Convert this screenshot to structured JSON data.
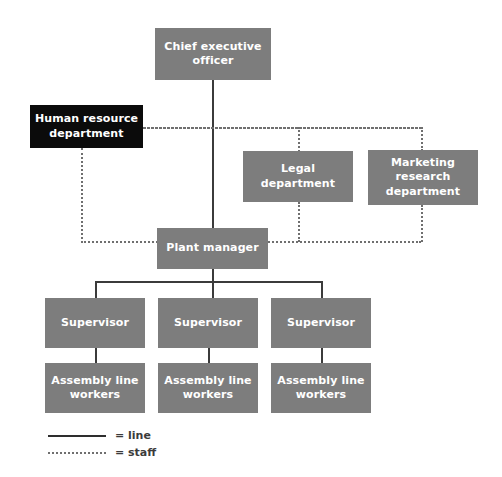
{
  "chart": {
    "type": "org-chart",
    "canvas": {
      "width": 502,
      "height": 477,
      "background": "#ffffff"
    },
    "colors": {
      "node_fill": "#7d7d7d",
      "node_fill_highlight": "#0b0b0b",
      "node_text": "#ffffff",
      "line_solid": "#3b3b3b",
      "line_staff": "#6f6f6f"
    }
  },
  "nodes": [
    {
      "id": "ceo",
      "label": "Chief executive officer",
      "style": "gray",
      "x": 155,
      "y": 28,
      "w": 116,
      "h": 52,
      "font_size": 11
    },
    {
      "id": "hr",
      "label": "Human resource department",
      "style": "black",
      "x": 30,
      "y": 105,
      "w": 113,
      "h": 43,
      "font_size": 11
    },
    {
      "id": "legal",
      "label": "Legal department",
      "style": "gray",
      "x": 243,
      "y": 151,
      "w": 110,
      "h": 51,
      "font_size": 11
    },
    {
      "id": "marketing",
      "label": "Marketing research department",
      "style": "gray",
      "x": 368,
      "y": 150,
      "w": 110,
      "h": 55,
      "font_size": 11
    },
    {
      "id": "plant",
      "label": "Plant manager",
      "style": "gray",
      "x": 157,
      "y": 228,
      "w": 111,
      "h": 41,
      "font_size": 11
    },
    {
      "id": "sup1",
      "label": "Supervisor",
      "style": "gray",
      "x": 45,
      "y": 298,
      "w": 100,
      "h": 50,
      "font_size": 11
    },
    {
      "id": "sup2",
      "label": "Supervisor",
      "style": "gray",
      "x": 158,
      "y": 298,
      "w": 100,
      "h": 50,
      "font_size": 11
    },
    {
      "id": "sup3",
      "label": "Supervisor",
      "style": "gray",
      "x": 271,
      "y": 298,
      "w": 100,
      "h": 50,
      "font_size": 11
    },
    {
      "id": "alw1",
      "label": "Assembly line workers",
      "style": "gray",
      "x": 45,
      "y": 363,
      "w": 100,
      "h": 50,
      "font_size": 11
    },
    {
      "id": "alw2",
      "label": "Assembly line workers",
      "style": "gray",
      "x": 158,
      "y": 363,
      "w": 100,
      "h": 50,
      "font_size": 11
    },
    {
      "id": "alw3",
      "label": "Assembly line workers",
      "style": "gray",
      "x": 271,
      "y": 363,
      "w": 100,
      "h": 50,
      "font_size": 11
    }
  ],
  "connectors": {
    "line": [
      {
        "id": "ceo-to-plant",
        "orient": "v",
        "x": 212,
        "y": 80,
        "len": 148
      },
      {
        "id": "plant-to-bus",
        "orient": "v",
        "x": 212,
        "y": 269,
        "len": 29
      },
      {
        "id": "supervisor-bus",
        "orient": "h",
        "x": 95,
        "y": 281,
        "len": 226
      },
      {
        "id": "bus-to-sup1",
        "orient": "v",
        "x": 95,
        "y": 281,
        "len": 17
      },
      {
        "id": "bus-to-sup3",
        "orient": "v",
        "x": 321,
        "y": 281,
        "len": 17
      },
      {
        "id": "sup1-to-alw1",
        "orient": "v",
        "x": 95,
        "y": 348,
        "len": 15
      },
      {
        "id": "sup2-to-alw2",
        "orient": "v",
        "x": 208,
        "y": 348,
        "len": 15
      },
      {
        "id": "sup3-to-alw3",
        "orient": "v",
        "x": 321,
        "y": 348,
        "len": 15
      }
    ],
    "staff": [
      {
        "id": "top-staff-bus",
        "orient": "h",
        "x": 81,
        "y": 127,
        "len": 340
      },
      {
        "id": "hr-right-stub",
        "orient": "h",
        "x": 143,
        "y": 127,
        "len": 278
      },
      {
        "id": "legal-up",
        "orient": "v",
        "x": 298,
        "y": 127,
        "len": 25
      },
      {
        "id": "marketing-up",
        "orient": "v",
        "x": 421,
        "y": 127,
        "len": 24
      },
      {
        "id": "hr-down",
        "orient": "v",
        "x": 81,
        "y": 148,
        "len": 95
      },
      {
        "id": "bottom-staff-bus",
        "orient": "h",
        "x": 81,
        "y": 241,
        "len": 340
      },
      {
        "id": "legal-down",
        "orient": "v",
        "x": 298,
        "y": 202,
        "len": 40
      },
      {
        "id": "marketing-down",
        "orient": "v",
        "x": 421,
        "y": 205,
        "len": 37
      }
    ]
  },
  "legend": {
    "items": [
      {
        "id": "legend-line",
        "swatch": "solid",
        "label": "= line"
      },
      {
        "id": "legend-staff",
        "swatch": "dotted",
        "label": "= staff"
      }
    ]
  },
  "chart_data": {
    "type": "diagram",
    "hierarchy": {
      "name": "Chief executive officer",
      "relation": "root",
      "children": [
        {
          "name": "Plant manager",
          "relation": "line",
          "children": [
            {
              "name": "Supervisor",
              "relation": "line",
              "children": [
                {
                  "name": "Assembly line workers",
                  "relation": "line",
                  "children": []
                }
              ]
            },
            {
              "name": "Supervisor",
              "relation": "line",
              "children": [
                {
                  "name": "Assembly line workers",
                  "relation": "line",
                  "children": []
                }
              ]
            },
            {
              "name": "Supervisor",
              "relation": "line",
              "children": [
                {
                  "name": "Assembly line workers",
                  "relation": "line",
                  "children": []
                }
              ]
            }
          ]
        }
      ]
    },
    "staff_units": [
      "Human resource department",
      "Legal department",
      "Marketing research department"
    ],
    "staff_connections": [
      {
        "from": "Human resource department",
        "to": "Plant manager",
        "relation": "staff"
      },
      {
        "from": "Legal department",
        "to": "Plant manager",
        "relation": "staff"
      },
      {
        "from": "Marketing research department",
        "to": "Plant manager",
        "relation": "staff"
      },
      {
        "from": "Human resource department",
        "to": "Legal department",
        "relation": "staff"
      },
      {
        "from": "Legal department",
        "to": "Marketing research department",
        "relation": "staff"
      }
    ],
    "highlighted_node": "Human resource department",
    "legend": [
      {
        "style": "solid line",
        "meaning": "line"
      },
      {
        "style": "dotted line",
        "meaning": "staff"
      }
    ]
  }
}
